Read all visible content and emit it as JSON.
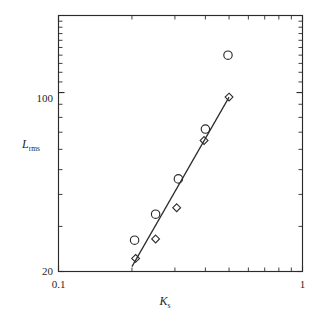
{
  "chart_data": {
    "type": "scatter",
    "title": "",
    "xlabel": "K",
    "xlabel_sub": "s",
    "ylabel": "L",
    "ylabel_sub": "rms",
    "xscale": "log",
    "yscale": "log",
    "xlim": [
      0.1,
      1.0
    ],
    "ylim": [
      20,
      200
    ],
    "grid": false,
    "legend": "none",
    "xticks": [
      {
        "value": 0.1,
        "label": "0.1",
        "major": true
      },
      {
        "value": 0.2,
        "label": "",
        "major": false
      },
      {
        "value": 0.3,
        "label": "",
        "major": false
      },
      {
        "value": 0.4,
        "label": "",
        "major": false
      },
      {
        "value": 0.5,
        "label": "",
        "major": false
      },
      {
        "value": 0.6,
        "label": "",
        "major": false
      },
      {
        "value": 0.7,
        "label": "",
        "major": false
      },
      {
        "value": 0.8,
        "label": "",
        "major": false
      },
      {
        "value": 0.9,
        "label": "",
        "major": false
      },
      {
        "value": 1.0,
        "label": "1",
        "major": true
      }
    ],
    "yticks": [
      {
        "value": 20,
        "label": "20",
        "major": true
      },
      {
        "value": 30,
        "label": "",
        "major": false
      },
      {
        "value": 40,
        "label": "",
        "major": false
      },
      {
        "value": 50,
        "label": "",
        "major": false
      },
      {
        "value": 60,
        "label": "",
        "major": false
      },
      {
        "value": 70,
        "label": "",
        "major": false
      },
      {
        "value": 80,
        "label": "",
        "major": false
      },
      {
        "value": 90,
        "label": "",
        "major": false
      },
      {
        "value": 100,
        "label": "100",
        "major": true
      },
      {
        "value": 200,
        "label": "",
        "major": false
      }
    ],
    "series": [
      {
        "name": "circles",
        "marker": "circle",
        "points": [
          {
            "x": 0.205,
            "y": 26.5
          },
          {
            "x": 0.25,
            "y": 33.5
          },
          {
            "x": 0.31,
            "y": 46.0
          },
          {
            "x": 0.4,
            "y": 72.0
          },
          {
            "x": 0.495,
            "y": 140.0
          }
        ]
      },
      {
        "name": "diamonds",
        "marker": "diamond",
        "points": [
          {
            "x": 0.207,
            "y": 22.5
          },
          {
            "x": 0.25,
            "y": 26.8
          },
          {
            "x": 0.305,
            "y": 35.5
          },
          {
            "x": 0.395,
            "y": 65.0
          },
          {
            "x": 0.5,
            "y": 96.0
          }
        ]
      }
    ],
    "fit_line": {
      "name": "power-law fit",
      "x_start": 0.2,
      "y_start": 20.9,
      "x_end": 0.5,
      "y_end": 96.0
    }
  },
  "axes": {
    "x_min_label": "0.1",
    "x_max_label": "1",
    "y_min_label": "20",
    "y_mid_label": "100"
  }
}
